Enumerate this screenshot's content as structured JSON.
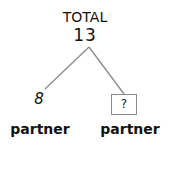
{
  "diagram": {
    "type": "part-whole bar model",
    "total": {
      "label": "TOTAL",
      "value": "13"
    },
    "parts": [
      {
        "value": "8",
        "label": "partner",
        "unknown": false
      },
      {
        "value": "?",
        "label": "partner",
        "unknown": true
      }
    ],
    "colors": {
      "text": "#111111",
      "lines": "#8a8a8a",
      "background": "#ffffff"
    }
  }
}
